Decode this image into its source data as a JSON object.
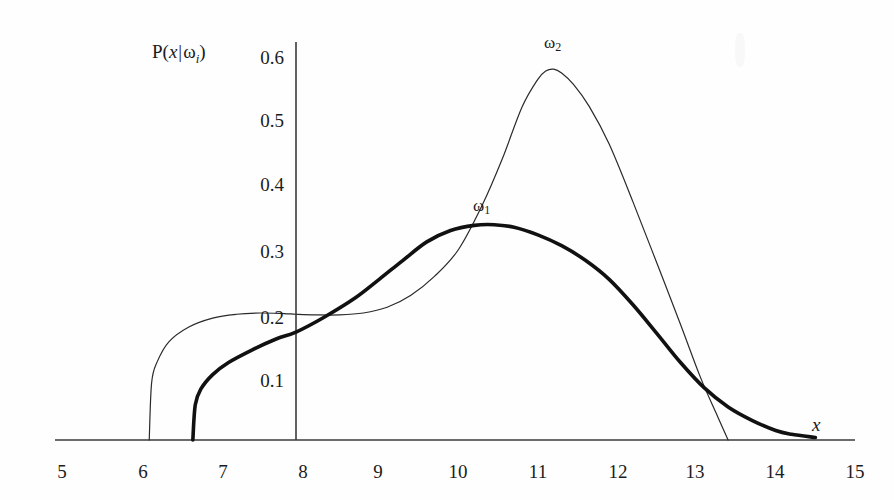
{
  "figure": {
    "background": "#fefefe",
    "ink_color": "#1a1a1a"
  },
  "axes": {
    "x_title": "x",
    "y_title_prefix": "P(",
    "y_title_var": "x",
    "y_title_bar": "|",
    "y_title_omega": "ω",
    "y_title_sub": "i",
    "y_title_suffix": ")",
    "x_ticks": [
      "5",
      "6",
      "7",
      "8",
      "9",
      "10",
      "11",
      "12",
      "13",
      "14",
      "15"
    ],
    "y_ticks": [
      "0.1",
      "0.2",
      "0.3",
      "0.4",
      "0.5",
      "0.6"
    ]
  },
  "curves": {
    "omega1_label": "ω",
    "omega1_sub": "1",
    "omega2_label": "ω",
    "omega2_sub": "2"
  },
  "chart_data": {
    "type": "line",
    "title": "",
    "xlabel": "x",
    "ylabel": "P(x|ωi)",
    "xlim": [
      5,
      15
    ],
    "ylim": [
      0,
      0.65
    ],
    "xticks": [
      5,
      6,
      7,
      8,
      9,
      10,
      11,
      12,
      13,
      14,
      15
    ],
    "yticks": [
      0.1,
      0.2,
      0.3,
      0.4,
      0.5,
      0.6
    ],
    "grid": false,
    "legend": "inline-curve-labels",
    "y_axis_position_x": 7.95,
    "series": [
      {
        "name": "ω1",
        "style": "thick",
        "linewidth": 3.6,
        "color": "#111111",
        "x": [
          6.65,
          6.68,
          6.75,
          6.9,
          7.1,
          7.4,
          7.7,
          7.95,
          8.3,
          8.7,
          9.0,
          9.3,
          9.6,
          9.9,
          10.2,
          10.45,
          10.7,
          11.0,
          11.3,
          11.6,
          11.9,
          12.2,
          12.5,
          12.8,
          13.1,
          13.4,
          13.7,
          14.0,
          14.2,
          14.5
        ],
        "y": [
          0.0,
          0.055,
          0.08,
          0.103,
          0.122,
          0.142,
          0.159,
          0.17,
          0.193,
          0.224,
          0.253,
          0.283,
          0.312,
          0.33,
          0.338,
          0.339,
          0.335,
          0.323,
          0.306,
          0.283,
          0.253,
          0.213,
          0.168,
          0.122,
          0.082,
          0.052,
          0.031,
          0.015,
          0.009,
          0.004
        ]
      },
      {
        "name": "ω2",
        "style": "thin",
        "linewidth": 1.2,
        "color": "#2a2a2a",
        "x": [
          6.1,
          6.13,
          6.2,
          6.35,
          6.6,
          6.9,
          7.2,
          7.5,
          7.8,
          7.95,
          8.2,
          8.5,
          8.8,
          9.1,
          9.4,
          9.7,
          10.0,
          10.3,
          10.55,
          10.8,
          11.0,
          11.1,
          11.2,
          11.3,
          11.45,
          11.65,
          11.9,
          12.2,
          12.5,
          12.8,
          13.05,
          13.25,
          13.4
        ],
        "y": [
          0.0,
          0.09,
          0.123,
          0.155,
          0.178,
          0.192,
          0.198,
          0.2,
          0.199,
          0.198,
          0.197,
          0.197,
          0.2,
          0.209,
          0.228,
          0.258,
          0.3,
          0.37,
          0.442,
          0.524,
          0.568,
          0.581,
          0.584,
          0.578,
          0.56,
          0.525,
          0.466,
          0.375,
          0.279,
          0.182,
          0.099,
          0.042,
          0.0
        ]
      }
    ],
    "annotations": [
      {
        "text": "ω1",
        "x": 10.35,
        "y": 0.355
      },
      {
        "text": "ω2",
        "x": 11.15,
        "y": 0.625
      }
    ]
  }
}
